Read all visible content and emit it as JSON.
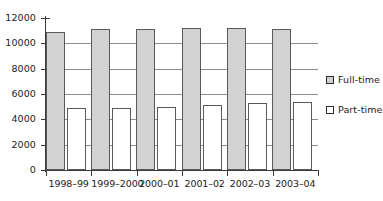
{
  "chart_data": {
    "type": "bar",
    "title": "",
    "xlabel": "",
    "ylabel": "",
    "ylim": [
      0,
      12000
    ],
    "ytick_step": 2000,
    "yticks": [
      "0",
      "2000",
      "4000",
      "6000",
      "8000",
      "10000",
      "12000"
    ],
    "grid": true,
    "grid_axis": "y",
    "legend_position": "right",
    "categories": [
      "1998–99",
      "1999–2000",
      "2000–01",
      "2001–02",
      "2002–03",
      "2003–04"
    ],
    "series": [
      {
        "name": "Full-time",
        "color": "#d2d2d2",
        "values": [
          10900,
          11100,
          11150,
          11200,
          11200,
          11150
        ]
      },
      {
        "name": "Part-time",
        "color": "#ffffff",
        "values": [
          4900,
          4920,
          5000,
          5120,
          5270,
          5400
        ]
      }
    ]
  },
  "legend": {
    "items": [
      {
        "label": "Full-time",
        "swatch": "filled-square-icon"
      },
      {
        "label": "Part-time",
        "swatch": "hollow-square-icon"
      }
    ]
  },
  "colors": {
    "full_time_fill": "#d2d2d2",
    "part_time_fill": "#ffffff",
    "bar_border": "#5a5a5a",
    "axis": "#3a3a3a",
    "gridline": "#8e8e8e",
    "text": "#1b1b1b",
    "background": "#ffffff"
  }
}
